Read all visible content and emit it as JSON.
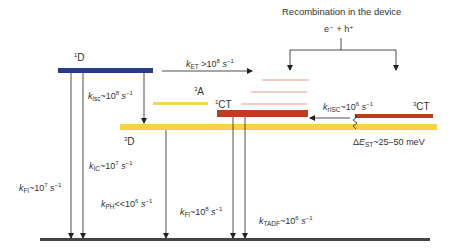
{
  "header": {
    "title": "Recombination in the device",
    "carriers": "e⁻ + h⁺"
  },
  "states": {
    "singlet_donor": {
      "label": "D",
      "multiplicity": "1",
      "color": "#283a8a"
    },
    "triplet_acceptor": {
      "label": "A",
      "multiplicity": "3",
      "color": "#f7d75a"
    },
    "singlet_ct": {
      "label": "CT",
      "multiplicity": "1",
      "color": "#b8401f"
    },
    "triplet_ct": {
      "label": "CT",
      "multiplicity": "3",
      "color": "#b8401f"
    },
    "triplet_donor": {
      "label": "D",
      "multiplicity": "3",
      "color": "#f5d24a"
    },
    "ground": {
      "color": "#444444"
    },
    "ct_manifold_lines_color": "#e0a08a"
  },
  "rates": {
    "k_et": {
      "k": "k",
      "sub": "ET",
      "rel": " >10",
      "exp": "8",
      "unit": " s",
      "unit_exp": "−1"
    },
    "k_isc": {
      "k": "k",
      "sub": "isc",
      "rel": "~10",
      "exp": "8",
      "unit": " s",
      "unit_exp": "−1"
    },
    "k_ic": {
      "k": "k",
      "sub": "IC",
      "rel": "~10",
      "exp": "7",
      "unit": " s",
      "unit_exp": "−1"
    },
    "k_fl_donor": {
      "k": "k",
      "sub": "Fl",
      "rel": "~10",
      "exp": "7",
      "unit": " s",
      "unit_exp": "−1"
    },
    "k_ph": {
      "k": "k",
      "sub": "PH",
      "rel": "<<10",
      "exp": "6",
      "unit": " s",
      "unit_exp": "−1"
    },
    "k_fl_ct": {
      "k": "k",
      "sub": "Fl",
      "rel": "~10",
      "exp": "8",
      "unit": " s",
      "unit_exp": "−1"
    },
    "k_tadf": {
      "k": "k",
      "sub": "TADF",
      "rel": "~10",
      "exp": "6",
      "unit": " s",
      "unit_exp": "−1"
    },
    "k_risc": {
      "k": "k",
      "sub": "rISC",
      "rel": "~10",
      "exp": "6",
      "unit": " s",
      "unit_exp": "−1"
    }
  },
  "energy_gap": {
    "delta": "Δ",
    "E": "E",
    "sub": "ST",
    "value": "~25–50 meV"
  }
}
